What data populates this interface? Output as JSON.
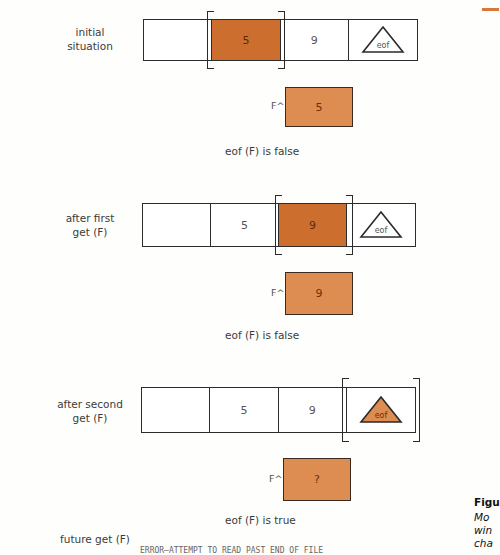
{
  "accent_color": "#d9773a",
  "window_fill_color": "#cc6e2e",
  "buffer_fill_color": "#de8d52",
  "panels": [
    {
      "label": "initial\nsituation",
      "cells": [
        "",
        "5",
        "9",
        "eof"
      ],
      "window_index": 1,
      "eof_marker_filled": false,
      "buffer_label": "F^",
      "buffer_value": "5",
      "status": "eof (F) is false"
    },
    {
      "label": "after first\nget (F)",
      "cells": [
        "",
        "5",
        "9",
        "eof"
      ],
      "window_index": 2,
      "eof_marker_filled": false,
      "buffer_label": "F^",
      "buffer_value": "9",
      "status": "eof (F) is false"
    },
    {
      "label": "after second\nget (F)",
      "cells": [
        "",
        "5",
        "9",
        "eof"
      ],
      "window_index": 3,
      "eof_marker_filled": true,
      "buffer_label": "F^",
      "buffer_value": "?",
      "status": "eof (F) is true"
    }
  ],
  "footer": {
    "label": "future get (F)",
    "error_text": "ERROR—ATTEMPT TO READ PAST END OF FILE"
  },
  "caption": {
    "title_fragment": "Figu",
    "lines": [
      "Mo",
      "win",
      "cha"
    ]
  }
}
